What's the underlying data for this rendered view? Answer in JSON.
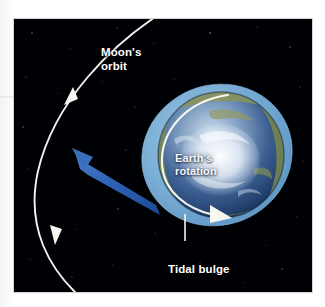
{
  "figure": {
    "background_color": "#ffffff",
    "panel_color": "#000105"
  },
  "labels": {
    "moon_orbit": "Moon's\norbit",
    "earth_rotation": "Earth's\nrotation",
    "tidal_bulge": "Tidal bulge"
  },
  "colors": {
    "space": "#000105",
    "orbit_line": "#f4f3ee",
    "tidal_bulge": "#7fb4dc",
    "ocean": "#27497f",
    "ice": "#e9f1f8",
    "land": "#7e8b51",
    "moon_light": "#d8d3c6",
    "moon_dark": "#8e887c",
    "force_arrow": "#2f63b5",
    "label_text": "#ffffff"
  },
  "objects": {
    "moon": {
      "name": "Moon",
      "cx": 47,
      "cy": 155,
      "r": 24
    },
    "earth": {
      "name": "Earth",
      "cx": 221,
      "cy": 155,
      "r": 63
    },
    "tidal_bulge_ring": {
      "name": "Tidal bulge",
      "rx": 76,
      "ry": 70,
      "rotation_deg": -22
    },
    "moon_orbit_path": {
      "name": "Moon's orbit",
      "arrowheads": 2
    },
    "rotation_arrow": {
      "name": "Earth's rotation",
      "direction": "counterclockwise"
    },
    "gravitational_arrow": {
      "name": "Tidal force toward Moon",
      "from": "earth-bulge",
      "to": "moon"
    }
  }
}
